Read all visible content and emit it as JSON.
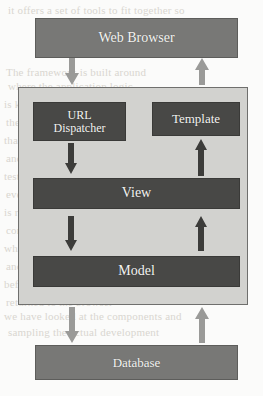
{
  "diagram": {
    "type": "flow-diagram",
    "colors": {
      "page_background": "#fbfbfa",
      "panel_fill": "#d2d2cf",
      "panel_border": "#6f6f6d",
      "node_mid_fill": "#787876",
      "node_dark_fill": "#484846",
      "node_text": "#f4f4f2",
      "arrow_light": "#9a9a98",
      "arrow_dark": "#3c3c3a",
      "bleed_text": "#d9d6d0"
    },
    "nodes": [
      {
        "id": "web-browser",
        "label": "Web Browser",
        "style": "mid",
        "zone": "outside-top"
      },
      {
        "id": "url-dispatcher",
        "label_line1": "URL",
        "label_line2": "Dispatcher",
        "label": "URL Dispatcher",
        "style": "dark",
        "zone": "panel"
      },
      {
        "id": "template",
        "label": "Template",
        "style": "dark",
        "zone": "panel"
      },
      {
        "id": "view",
        "label": "View",
        "style": "dark",
        "zone": "panel"
      },
      {
        "id": "model",
        "label": "Model",
        "style": "dark",
        "zone": "panel"
      },
      {
        "id": "database",
        "label": "Database",
        "style": "mid",
        "zone": "outside-bottom"
      }
    ],
    "arrows": [
      {
        "id": "browser-to-dispatcher",
        "from": "web-browser",
        "to": "url-dispatcher",
        "direction": "down",
        "tone": "light"
      },
      {
        "id": "template-to-browser",
        "from": "template",
        "to": "web-browser",
        "direction": "up",
        "tone": "light"
      },
      {
        "id": "dispatcher-to-view",
        "from": "url-dispatcher",
        "to": "view",
        "direction": "down",
        "tone": "dark"
      },
      {
        "id": "view-to-template",
        "from": "view",
        "to": "template",
        "direction": "up",
        "tone": "dark"
      },
      {
        "id": "view-to-model",
        "from": "view",
        "to": "model",
        "direction": "down",
        "tone": "dark"
      },
      {
        "id": "model-to-view",
        "from": "model",
        "to": "view",
        "direction": "up",
        "tone": "dark"
      },
      {
        "id": "model-to-database",
        "from": "model",
        "to": "database",
        "direction": "down",
        "tone": "light"
      },
      {
        "id": "database-to-model",
        "from": "database",
        "to": "model",
        "direction": "up",
        "tone": "light"
      }
    ],
    "background_text": [
      "it offers a set of tools to fit together so",
      "The framework is built around",
      "where the application logic",
      "is kept separate from",
      "the presentation layer so",
      "that code remains clean",
      "and each layer can be",
      "tested on its own terms",
      "every request that arrives",
      "is routed by the URL",
      "configuration to the view",
      "which talks to the model",
      "and renders a template",
      "before the response is",
      "returned to the browser",
      "we have looked at the components and",
      "sampling the actual development"
    ]
  }
}
